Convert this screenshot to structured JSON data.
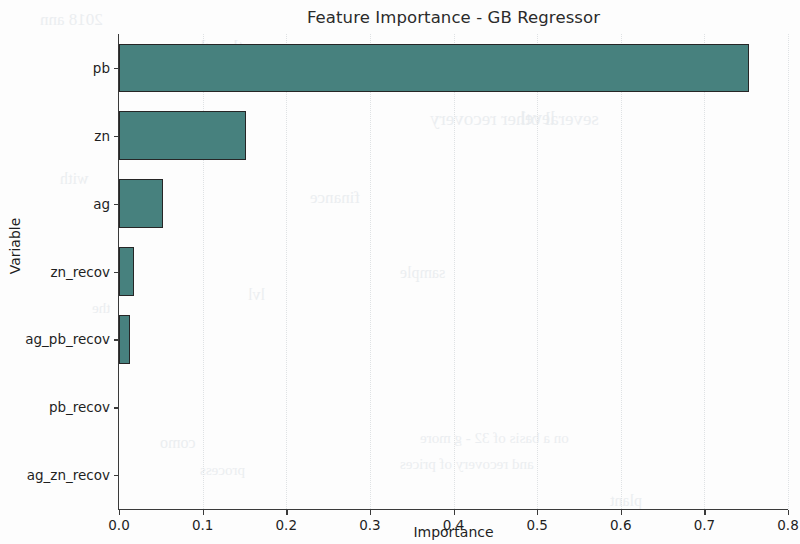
{
  "chart_data": {
    "type": "bar",
    "orientation": "horizontal",
    "title": "Feature Importance - GB Regressor",
    "xlabel": "Importance",
    "ylabel": "Variable",
    "categories": [
      "pb",
      "zn",
      "ag",
      "zn_recov",
      "ag_pb_recov",
      "pb_recov",
      "ag_zn_recov"
    ],
    "values": [
      0.753,
      0.152,
      0.053,
      0.018,
      0.013,
      0.0,
      0.0
    ],
    "xlim": [
      0.0,
      0.8
    ],
    "xticks": [
      "0.0",
      "0.1",
      "0.2",
      "0.3",
      "0.4",
      "0.5",
      "0.6",
      "0.7",
      "0.8"
    ],
    "xtick_values": [
      0.0,
      0.1,
      0.2,
      0.3,
      0.4,
      0.5,
      0.6,
      0.7,
      0.8
    ],
    "grid": "vertical-dotted",
    "legend": null,
    "bar_color": "#47817e",
    "bar_edge_color": "#262626",
    "axis_color": "#3a3a3a",
    "grid_color": "#dfe2e4"
  },
  "ghost_text": [
    {
      "text": "2018 ann",
      "x": 40,
      "y": 10,
      "size": 17
    },
    {
      "text": "the glory",
      "x": 175,
      "y": 36,
      "size": 19
    },
    {
      "text": "several other recovery",
      "x": 430,
      "y": 108,
      "size": 19
    },
    {
      "text": "mine",
      "x": 208,
      "y": 132,
      "size": 17
    },
    {
      "text": "with",
      "x": 60,
      "y": 170,
      "size": 16
    },
    {
      "text": "finance",
      "x": 310,
      "y": 188,
      "size": 17
    },
    {
      "text": "level",
      "x": 520,
      "y": 108,
      "size": 18
    },
    {
      "text": "lvl",
      "x": 248,
      "y": 286,
      "size": 16
    },
    {
      "text": "sample",
      "x": 400,
      "y": 264,
      "size": 16
    },
    {
      "text": "the",
      "x": 92,
      "y": 300,
      "size": 15
    },
    {
      "text": "como",
      "x": 160,
      "y": 434,
      "size": 16
    },
    {
      "text": "on a basis of 32  - g  more",
      "x": 420,
      "y": 430,
      "size": 15
    },
    {
      "text": "and recovery of prices",
      "x": 400,
      "y": 456,
      "size": 15
    },
    {
      "text": "process",
      "x": 200,
      "y": 462,
      "size": 15
    },
    {
      "text": "plant",
      "x": 610,
      "y": 492,
      "size": 16
    }
  ]
}
